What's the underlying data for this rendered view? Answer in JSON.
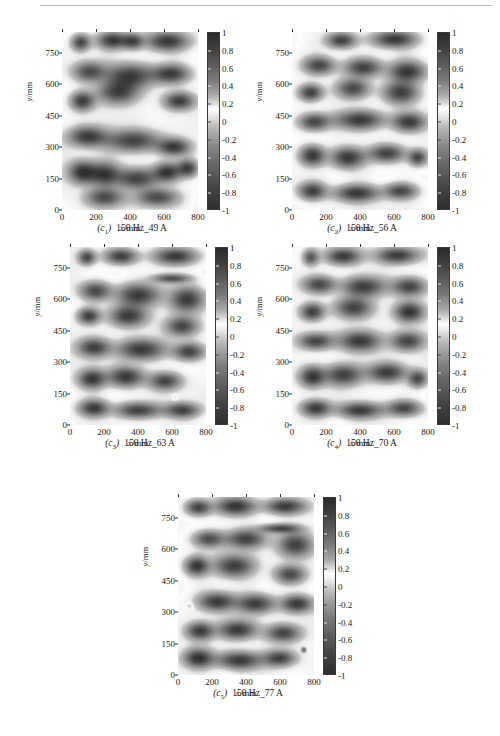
{
  "figure": {
    "axes": {
      "xlabel_var": "x",
      "xlabel_unit": "/mm",
      "ylabel_var": "y",
      "ylabel_unit": "/mm",
      "xticks": [
        "0",
        "200",
        "400",
        "600",
        "800"
      ],
      "yticks": [
        "0",
        "150",
        "300",
        "450",
        "600",
        "750"
      ],
      "xlim": [
        0,
        800
      ],
      "ylim": [
        0,
        850
      ]
    },
    "colorbar": {
      "ticks": [
        "1",
        "0.8",
        "0.6",
        "0.4",
        "0.2",
        "0",
        "-0.2",
        "-0.4",
        "-0.6",
        "-0.8",
        "-1"
      ],
      "vmin": -1,
      "vmax": 1,
      "colormap": "gray-diverging-dark-light-dark"
    },
    "panels": [
      {
        "id": "c1",
        "label_id": "(c",
        "label_sub": "1",
        "label_close": ")",
        "caption": "150 Hz_49 A",
        "frequency": "150 Hz",
        "current": "49 A"
      },
      {
        "id": "c2",
        "label_id": "(c",
        "label_sub": "2",
        "label_close": ")",
        "caption": "150 Hz_56 A",
        "frequency": "150 Hz",
        "current": "56 A"
      },
      {
        "id": "c3",
        "label_id": "(c",
        "label_sub": "3",
        "label_close": ")",
        "caption": "150 Hz_63 A",
        "frequency": "150 Hz",
        "current": "63 A"
      },
      {
        "id": "c4",
        "label_id": "(c",
        "label_sub": "4",
        "label_close": ")",
        "caption": "150 Hz_70 A",
        "frequency": "150 Hz",
        "current": "70 A"
      },
      {
        "id": "c5",
        "label_id": "(c",
        "label_sub": "5",
        "label_close": ")",
        "caption": "150 Hz_77 A",
        "frequency": "150 Hz",
        "current": "77 A"
      }
    ]
  },
  "captions": {
    "c1": "(c₁)  150 Hz_49 A",
    "c2": "(c₂)  150 Hz_56 A",
    "c3": "(c₃)  150 Hz_63 A",
    "c4": "(c₄)  150 Hz_70 A",
    "c5": "(c₅)  150 Hz_77 A"
  },
  "chart_data": {
    "type": "heatmap",
    "title": "",
    "xlabel": "x/mm",
    "ylabel": "y/mm",
    "xlim": [
      0,
      800
    ],
    "ylim": [
      0,
      850
    ],
    "zlim": [
      -1,
      1
    ],
    "grid": false,
    "legend_position": "right-colorbar",
    "colorbar_ticks": [
      1,
      0.8,
      0.6,
      0.4,
      0.2,
      0,
      -0.2,
      -0.4,
      -0.6,
      -0.8,
      -1
    ],
    "xticks": [
      0,
      200,
      400,
      600,
      800
    ],
    "yticks": [
      0,
      150,
      300,
      450,
      600,
      750
    ],
    "panels": [
      {
        "name": "(c₁) 150 Hz_49 A",
        "annotation": "150 Hz_49 A",
        "description": "Quasi-labyrinthine modal pattern, bright (near +0.2) ridge network separating dark (near -0.8) domains",
        "seed": 1049,
        "blobs": [
          [
            110,
            800,
            55,
            40,
            -0.8
          ],
          [
            300,
            810,
            95,
            42,
            -0.92
          ],
          [
            420,
            805,
            60,
            38,
            -0.7
          ],
          [
            620,
            805,
            120,
            45,
            -0.88
          ],
          [
            160,
            660,
            95,
            48,
            -0.72
          ],
          [
            400,
            640,
            140,
            60,
            -0.9
          ],
          [
            640,
            650,
            110,
            45,
            -0.85
          ],
          [
            120,
            520,
            70,
            45,
            -0.86
          ],
          [
            330,
            560,
            120,
            55,
            -0.8
          ],
          [
            690,
            520,
            90,
            42,
            -0.86
          ],
          [
            150,
            350,
            110,
            48,
            -0.88
          ],
          [
            420,
            330,
            160,
            52,
            -0.82
          ],
          [
            660,
            300,
            95,
            40,
            -0.86
          ],
          [
            120,
            180,
            80,
            55,
            -0.95
          ],
          [
            250,
            170,
            95,
            58,
            -0.92
          ],
          [
            440,
            150,
            120,
            50,
            -0.8
          ],
          [
            620,
            180,
            80,
            45,
            -0.9
          ],
          [
            740,
            200,
            60,
            42,
            -0.82
          ],
          [
            250,
            60,
            110,
            45,
            -0.75
          ],
          [
            560,
            60,
            120,
            42,
            -0.72
          ]
        ]
      },
      {
        "name": "(c₂) 150 Hz_56 A",
        "annotation": "150 Hz_56 A",
        "description": "Labyrinthine pattern with finer horizontal striping in upper region and strong dark cores lower-left",
        "seed": 1056,
        "blobs": [
          [
            290,
            810,
            85,
            38,
            -0.85
          ],
          [
            600,
            815,
            130,
            40,
            -0.9
          ],
          [
            160,
            690,
            95,
            42,
            -0.75
          ],
          [
            420,
            680,
            110,
            45,
            -0.82
          ],
          [
            680,
            660,
            110,
            50,
            -0.88
          ],
          [
            110,
            560,
            70,
            40,
            -0.86
          ],
          [
            360,
            580,
            95,
            48,
            -0.78
          ],
          [
            640,
            560,
            105,
            55,
            -0.9
          ],
          [
            130,
            420,
            90,
            42,
            -0.8
          ],
          [
            400,
            430,
            150,
            45,
            -0.84
          ],
          [
            690,
            420,
            95,
            45,
            -0.86
          ],
          [
            120,
            260,
            75,
            48,
            -0.95
          ],
          [
            330,
            250,
            100,
            50,
            -0.92
          ],
          [
            560,
            270,
            110,
            42,
            -0.8
          ],
          [
            740,
            250,
            55,
            38,
            -0.76
          ],
          [
            120,
            90,
            80,
            42,
            -0.84
          ],
          [
            380,
            80,
            130,
            40,
            -0.88
          ],
          [
            640,
            90,
            95,
            38,
            -0.78
          ]
        ]
      },
      {
        "name": "(c₃) 150 Hz_63 A",
        "annotation": "150 Hz_63 A",
        "description": "Denser labyrinth with additional thin horizontal band near y=690 and small ring defect near (620,130)",
        "seed": 1063,
        "blobs": [
          [
            100,
            800,
            50,
            35,
            -0.78
          ],
          [
            300,
            805,
            95,
            38,
            -0.86
          ],
          [
            620,
            805,
            125,
            40,
            -0.88
          ],
          [
            600,
            700,
            110,
            22,
            -0.7
          ],
          [
            150,
            640,
            90,
            45,
            -0.78
          ],
          [
            400,
            620,
            130,
            55,
            -0.88
          ],
          [
            690,
            600,
            100,
            60,
            -0.85
          ],
          [
            110,
            520,
            65,
            38,
            -0.84
          ],
          [
            340,
            520,
            110,
            50,
            -0.9
          ],
          [
            660,
            470,
            95,
            48,
            -0.8
          ],
          [
            140,
            370,
            95,
            45,
            -0.82
          ],
          [
            420,
            360,
            140,
            50,
            -0.9
          ],
          [
            700,
            350,
            90,
            42,
            -0.84
          ],
          [
            130,
            220,
            80,
            45,
            -0.88
          ],
          [
            330,
            230,
            105,
            48,
            -0.92
          ],
          [
            560,
            210,
            95,
            42,
            -0.78
          ],
          [
            620,
            130,
            18,
            16,
            0.35
          ],
          [
            140,
            80,
            85,
            40,
            -0.86
          ],
          [
            400,
            70,
            130,
            38,
            -0.84
          ],
          [
            660,
            70,
            100,
            36,
            -0.8
          ]
        ]
      },
      {
        "name": "(c₄) 150 Hz_70 A",
        "annotation": "150 Hz_70 A",
        "description": "Labyrinthine pattern with isolated bright-ringed blob upper-left and very dark core near (690,540)",
        "seed": 1070,
        "blobs": [
          [
            110,
            800,
            45,
            38,
            -0.62
          ],
          [
            300,
            805,
            100,
            40,
            -0.88
          ],
          [
            620,
            810,
            125,
            40,
            -0.9
          ],
          [
            160,
            670,
            95,
            42,
            -0.78
          ],
          [
            420,
            660,
            125,
            48,
            -0.84
          ],
          [
            690,
            660,
            100,
            45,
            -0.82
          ],
          [
            120,
            540,
            70,
            42,
            -0.86
          ],
          [
            360,
            560,
            110,
            50,
            -0.8
          ],
          [
            690,
            540,
            85,
            48,
            -0.97
          ],
          [
            140,
            400,
            100,
            40,
            -0.8
          ],
          [
            400,
            400,
            120,
            48,
            -0.88
          ],
          [
            680,
            400,
            95,
            45,
            -0.78
          ],
          [
            120,
            230,
            75,
            50,
            -0.92
          ],
          [
            300,
            240,
            110,
            52,
            -0.86
          ],
          [
            560,
            250,
            115,
            45,
            -0.84
          ],
          [
            740,
            220,
            55,
            40,
            -0.74
          ],
          [
            140,
            80,
            85,
            40,
            -0.88
          ],
          [
            400,
            70,
            130,
            38,
            -0.86
          ],
          [
            660,
            80,
            100,
            38,
            -0.78
          ]
        ]
      },
      {
        "name": "(c₅) 150 Hz_77 A",
        "annotation": "150 Hz_77 A",
        "description": "Most developed labyrinth, strong dark cores across field, small bright ring near (70,330) and dot near (740,120)",
        "seed": 1077,
        "blobs": [
          [
            120,
            800,
            75,
            38,
            -0.82
          ],
          [
            340,
            805,
            110,
            42,
            -0.92
          ],
          [
            630,
            805,
            120,
            38,
            -0.88
          ],
          [
            600,
            700,
            115,
            22,
            -0.78
          ],
          [
            180,
            650,
            90,
            40,
            -0.72
          ],
          [
            400,
            650,
            120,
            45,
            -0.8
          ],
          [
            690,
            620,
            100,
            60,
            -0.86
          ],
          [
            110,
            520,
            70,
            45,
            -0.9
          ],
          [
            330,
            520,
            115,
            52,
            -0.82
          ],
          [
            660,
            480,
            90,
            45,
            -0.8
          ],
          [
            70,
            330,
            20,
            18,
            0.4
          ],
          [
            230,
            350,
            110,
            45,
            -0.88
          ],
          [
            460,
            340,
            110,
            45,
            -0.84
          ],
          [
            700,
            340,
            90,
            42,
            -0.9
          ],
          [
            130,
            210,
            80,
            42,
            -0.86
          ],
          [
            350,
            215,
            110,
            45,
            -0.88
          ],
          [
            620,
            200,
            100,
            42,
            -0.78
          ],
          [
            120,
            80,
            85,
            45,
            -0.92
          ],
          [
            360,
            70,
            135,
            42,
            -0.9
          ],
          [
            600,
            80,
            90,
            38,
            -0.8
          ],
          [
            740,
            120,
            14,
            12,
            -0.55
          ]
        ]
      }
    ]
  }
}
